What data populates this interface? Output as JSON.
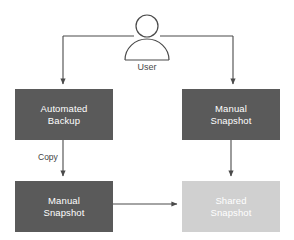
{
  "diagram": {
    "background_color": "#ffffff",
    "stroke_color": "#4a4a4a",
    "actor": {
      "name": "user-actor",
      "label": "User",
      "icon": "person-icon",
      "head_center_x": 147,
      "head_center_y": 26,
      "head_radius": 11,
      "body_center_x": 147,
      "body_top_y": 41,
      "body_radius": 22,
      "label_x": 147,
      "label_y": 68
    },
    "nodes": [
      {
        "id": "automated-backup",
        "label": "Automated\nBackup",
        "fill": "#5a5a5a",
        "text_color": "#ffffff",
        "x": 15,
        "y": 89,
        "width": 98,
        "height": 51
      },
      {
        "id": "manual-snapshot-top",
        "label": "Manual\nSnapshot",
        "fill": "#5a5a5a",
        "text_color": "#ffffff",
        "x": 182,
        "y": 89,
        "width": 98,
        "height": 51
      },
      {
        "id": "manual-snapshot-bottom",
        "label": "Manual\nSnapshot",
        "fill": "#5a5a5a",
        "text_color": "#ffffff",
        "x": 15,
        "y": 181,
        "width": 98,
        "height": 51
      },
      {
        "id": "shared-snapshot",
        "label": "Shared\nSnapshot",
        "fill": "#d0d0d0",
        "text_color": "#ffffff",
        "x": 182,
        "y": 181,
        "width": 98,
        "height": 51
      }
    ],
    "edges": [
      {
        "id": "user-to-automated-backup",
        "from": "user-actor",
        "to": "automated-backup",
        "label": "",
        "arrow": true
      },
      {
        "id": "user-to-manual-snapshot-top",
        "from": "user-actor",
        "to": "manual-snapshot-top",
        "label": "",
        "arrow": true
      },
      {
        "id": "automated-backup-to-manual-snapshot-bottom",
        "from": "automated-backup",
        "to": "manual-snapshot-bottom",
        "label": "Copy",
        "label_x": 49,
        "label_y": 156,
        "arrow": true
      },
      {
        "id": "manual-snapshot-top-to-shared-snapshot",
        "from": "manual-snapshot-top",
        "to": "shared-snapshot",
        "label": "",
        "arrow": true
      },
      {
        "id": "manual-snapshot-bottom-to-shared-snapshot",
        "from": "manual-snapshot-bottom",
        "to": "shared-snapshot",
        "label": "",
        "arrow": true
      }
    ]
  }
}
